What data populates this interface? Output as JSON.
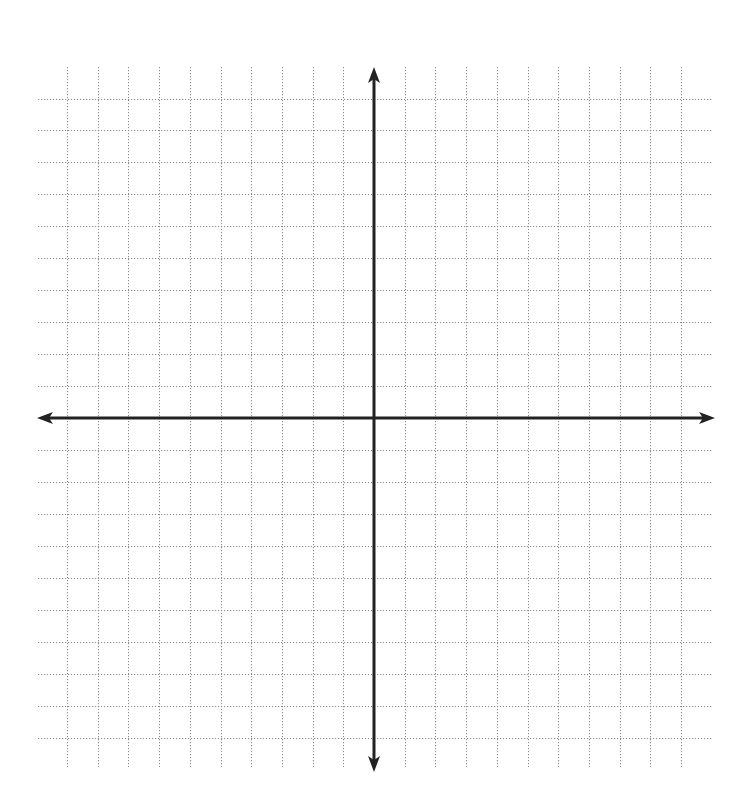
{
  "diagram": {
    "type": "coordinate-plane",
    "grid": {
      "columns_left_of_y_axis": 10,
      "columns_right_of_y_axis": 10,
      "rows_above_x_axis": 10,
      "rows_below_x_axis": 10,
      "line_style": "dotted",
      "line_color": "#8a8a8a"
    },
    "axes": {
      "color": "#222222",
      "x_axis": {
        "arrows": [
          "left",
          "right"
        ],
        "labels": []
      },
      "y_axis": {
        "arrows": [
          "up",
          "down"
        ],
        "labels": []
      }
    },
    "labels": []
  },
  "layout": {
    "origin_x": 374,
    "origin_y": 418,
    "step_x": 30.7,
    "step_y": 31.95,
    "h_line_x_start": 38,
    "h_line_x_end": 713,
    "v_line_y_start": 67,
    "v_line_y_end": 767,
    "x_axis_start": 37,
    "x_axis_end": 715,
    "y_axis_start": 67,
    "y_axis_end": 772
  }
}
